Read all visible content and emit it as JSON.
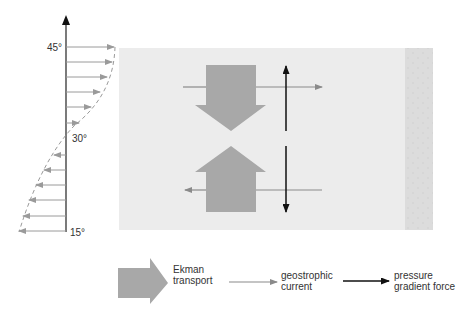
{
  "colors": {
    "ocean": "#ececec",
    "coast": "#dcdcdc",
    "ekman": "#a8a8a8",
    "geostrophic": "#8a8a8a",
    "pressure": "#111111",
    "profile": "#9a9a9a"
  },
  "latitude_axis": {
    "labels": {
      "top": "45°",
      "middle": "30°",
      "bottom": "15°"
    }
  },
  "legend": {
    "ekman": {
      "line1": "Ekman",
      "line2": "transport"
    },
    "geostrophic": {
      "line1": "geostrophic",
      "line2": "current"
    },
    "pressure": {
      "line1": "pressure",
      "line2": "gradient force"
    }
  }
}
